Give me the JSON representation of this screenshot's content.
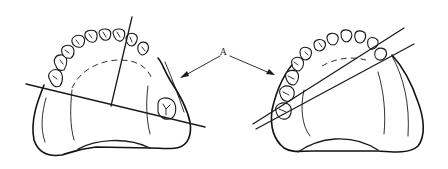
{
  "figure": {
    "label": "A",
    "colors": {
      "ink": "#1a1a1a",
      "background": "#ffffff"
    }
  },
  "arches": [
    {
      "name": "left-arch",
      "lines": 2,
      "line_type": "crossed fulcrum lines (one diagonal, one near-vertical)"
    },
    {
      "name": "right-arch",
      "lines": 2,
      "line_type": "two near-parallel diagonal lines"
    }
  ]
}
